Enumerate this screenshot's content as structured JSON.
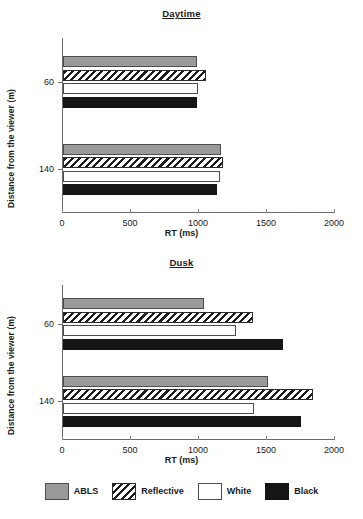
{
  "figure": {
    "axis_label_y": "Distance from the viewer (m)",
    "axis_label_x": "RT (ms)"
  },
  "legend": {
    "items": [
      {
        "label": "ABLS",
        "swatch": "solid-gray-swatch",
        "color": "#9a9a9a"
      },
      {
        "label": "Reflective",
        "swatch": "diagonal-hatch-swatch",
        "color": "#1d1d1d"
      },
      {
        "label": "White",
        "swatch": "solid-white-swatch",
        "color": "#ffffff"
      },
      {
        "label": "Black",
        "swatch": "solid-black-swatch",
        "color": "#151515"
      }
    ]
  },
  "panels": {
    "daytime": {
      "title": "Daytime",
      "xticks": [
        "0",
        "500",
        "1000",
        "1500",
        "2000"
      ],
      "yticks": [
        "60",
        "140"
      ]
    },
    "dusk": {
      "title": "Dusk",
      "xticks": [
        "0",
        "500",
        "1000",
        "1500",
        "2000"
      ],
      "yticks": [
        "60",
        "140"
      ]
    }
  },
  "chart_data": [
    {
      "type": "bar",
      "orientation": "horizontal",
      "title": "Daytime",
      "xlabel": "RT (ms)",
      "ylabel": "Distance from the viewer (m)",
      "categories": [
        "60",
        "140"
      ],
      "xlim": [
        0,
        2000
      ],
      "xticks": [
        0,
        500,
        1000,
        1500,
        2000
      ],
      "grid": false,
      "legend_position": "bottom",
      "series": [
        {
          "name": "ABLS",
          "values": [
            985,
            1162
          ]
        },
        {
          "name": "Reflective",
          "values": [
            1051,
            1176
          ]
        },
        {
          "name": "White",
          "values": [
            993,
            1154
          ]
        },
        {
          "name": "Black",
          "values": [
            985,
            1132
          ]
        }
      ]
    },
    {
      "type": "bar",
      "orientation": "horizontal",
      "title": "Dusk",
      "xlabel": "RT (ms)",
      "ylabel": "Distance from the viewer (m)",
      "categories": [
        "60",
        "140"
      ],
      "xlim": [
        0,
        2000
      ],
      "xticks": [
        0,
        500,
        1000,
        1500,
        2000
      ],
      "grid": false,
      "legend_position": "bottom",
      "series": [
        {
          "name": "ABLS",
          "values": [
            1037,
            1507
          ]
        },
        {
          "name": "Reflective",
          "values": [
            1397,
            1838
          ]
        },
        {
          "name": "White",
          "values": [
            1272,
            1404
          ]
        },
        {
          "name": "Black",
          "values": [
            1618,
            1750
          ]
        }
      ]
    }
  ]
}
